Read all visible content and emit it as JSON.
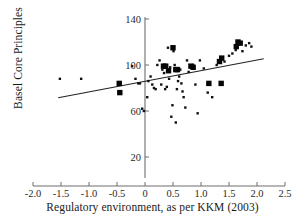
{
  "chart_data": {
    "type": "scatter",
    "title": "",
    "xlabel": "Regulatory environment, as per KKM (2003)",
    "ylabel": "Basel Core Principles",
    "xlim": [
      -2.0,
      2.5
    ],
    "ylim": [
      0,
      145
    ],
    "grid": false,
    "legend": "none",
    "xticks": [
      "-2.0",
      "-1.5",
      "-1.0",
      "-0.5",
      "0",
      "0.5",
      "1.0",
      "1.5",
      "2.0",
      "2.5"
    ],
    "xtick_values": [
      -2.0,
      -1.5,
      -1.0,
      -0.5,
      0,
      0.5,
      1.0,
      1.5,
      2.0,
      2.5
    ],
    "yticks": [
      "20",
      "60",
      "100",
      "140"
    ],
    "ytick_values": [
      20,
      60,
      100,
      140
    ],
    "trend_line": {
      "x": [
        -1.55,
        2.12
      ],
      "y": [
        71.5,
        105.5
      ],
      "slope": 9.3,
      "intercept": 85.9
    },
    "series": [
      {
        "name": "dots",
        "marker": "dot",
        "points": [
          [
            -1.52,
            88
          ],
          [
            -1.14,
            88
          ],
          [
            -0.23,
            99
          ],
          [
            -0.17,
            88
          ],
          [
            -0.12,
            84
          ],
          [
            -0.09,
            84
          ],
          [
            -0.05,
            62
          ],
          [
            -0.02,
            60
          ],
          [
            0.04,
            72
          ],
          [
            0.06,
            86
          ],
          [
            0.1,
            90
          ],
          [
            0.13,
            83
          ],
          [
            0.16,
            80
          ],
          [
            0.19,
            79
          ],
          [
            0.22,
            100
          ],
          [
            0.26,
            104
          ],
          [
            0.29,
            83
          ],
          [
            0.31,
            96
          ],
          [
            0.34,
            93
          ],
          [
            0.36,
            79
          ],
          [
            0.39,
            81
          ],
          [
            0.41,
            115
          ],
          [
            0.43,
            88
          ],
          [
            0.45,
            98
          ],
          [
            0.47,
            55
          ],
          [
            0.49,
            65
          ],
          [
            0.51,
            112
          ],
          [
            0.53,
            100
          ],
          [
            0.55,
            50
          ],
          [
            0.57,
            79
          ],
          [
            0.59,
            86
          ],
          [
            0.61,
            90
          ],
          [
            0.63,
            96
          ],
          [
            0.65,
            84
          ],
          [
            0.67,
            77
          ],
          [
            0.69,
            72
          ],
          [
            0.72,
            63
          ],
          [
            0.75,
            104
          ],
          [
            0.78,
            94
          ],
          [
            0.82,
            98
          ],
          [
            0.86,
            100
          ],
          [
            0.9,
            83
          ],
          [
            0.94,
            58
          ],
          [
            0.98,
            104
          ],
          [
            1.05,
            97
          ],
          [
            1.12,
            76
          ],
          [
            1.2,
            72
          ],
          [
            1.28,
            100
          ],
          [
            1.35,
            105
          ],
          [
            1.42,
            103
          ],
          [
            1.5,
            108
          ],
          [
            1.56,
            110
          ],
          [
            1.62,
            113
          ],
          [
            1.68,
            118
          ],
          [
            1.74,
            112
          ],
          [
            1.8,
            117
          ],
          [
            1.86,
            119
          ],
          [
            1.9,
            116
          ]
        ]
      },
      {
        "name": "squares",
        "marker": "square",
        "points": [
          [
            -0.46,
            84
          ],
          [
            -0.45,
            76
          ],
          [
            0.33,
            99
          ],
          [
            0.37,
            99
          ],
          [
            0.42,
            95
          ],
          [
            0.5,
            115
          ],
          [
            0.55,
            96
          ],
          [
            0.58,
            96
          ],
          [
            0.82,
            99
          ],
          [
            0.86,
            98
          ],
          [
            1.14,
            84
          ],
          [
            1.36,
            84
          ],
          [
            1.33,
            103
          ],
          [
            1.37,
            106
          ],
          [
            1.63,
            116
          ],
          [
            1.66,
            120
          ],
          [
            1.7,
            119
          ]
        ]
      }
    ]
  },
  "axes": {
    "y_axis_title": "Basel Core Principles",
    "x_axis_title": "Regulatory environment, as per KKM (2003)"
  }
}
